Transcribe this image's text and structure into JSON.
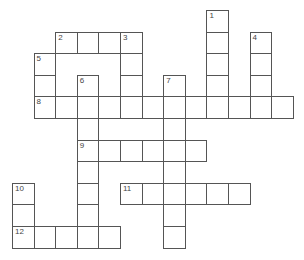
{
  "puzzle": {
    "type": "crossword",
    "grid": {
      "origin_x": 12,
      "origin_y": 10,
      "cell_size": 21.6,
      "line_color": "#555555"
    },
    "entries": [
      {
        "number": "1",
        "direction": "down",
        "row": 0,
        "col": 9,
        "length": 5
      },
      {
        "number": "2",
        "direction": "across",
        "row": 1,
        "col": 2,
        "length": 4
      },
      {
        "number": "3",
        "direction": "down",
        "row": 1,
        "col": 5,
        "length": 4
      },
      {
        "number": "4",
        "direction": "down",
        "row": 1,
        "col": 11,
        "length": 4
      },
      {
        "number": "5",
        "direction": "down",
        "row": 2,
        "col": 1,
        "length": 3
      },
      {
        "number": "6",
        "direction": "down",
        "row": 3,
        "col": 3,
        "length": 8
      },
      {
        "number": "7",
        "direction": "down",
        "row": 3,
        "col": 7,
        "length": 8
      },
      {
        "number": "8",
        "direction": "across",
        "row": 4,
        "col": 1,
        "length": 12
      },
      {
        "number": "9",
        "direction": "across",
        "row": 6,
        "col": 3,
        "length": 6
      },
      {
        "number": "10",
        "direction": "down",
        "row": 8,
        "col": 0,
        "length": 3
      },
      {
        "number": "11",
        "direction": "across",
        "row": 8,
        "col": 5,
        "length": 6
      },
      {
        "number": "12",
        "direction": "across",
        "row": 10,
        "col": 0,
        "length": 5
      }
    ]
  }
}
